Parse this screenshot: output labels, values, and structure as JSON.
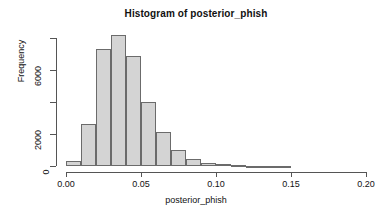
{
  "chart_data": {
    "type": "bar",
    "title": "Histogram of posterior_phish",
    "xlabel": "posterior_phish",
    "ylabel": "Frequency",
    "xlim": [
      0.0,
      0.2
    ],
    "ylim": [
      0,
      8400
    ],
    "grid": false,
    "legend": null,
    "bin_width": 0.01,
    "xticks": [
      0.0,
      0.05,
      0.1,
      0.15,
      0.2
    ],
    "xtick_labels": [
      "0.00",
      "0.05",
      "0.10",
      "0.15",
      "0.20"
    ],
    "yticks": [
      0,
      2000,
      4000,
      6000,
      8000
    ],
    "ytick_labels": [
      "0",
      "2000",
      "",
      "6000",
      ""
    ],
    "bin_edges": [
      0.0,
      0.01,
      0.02,
      0.03,
      0.04,
      0.05,
      0.06,
      0.07,
      0.08,
      0.09,
      0.1,
      0.11,
      0.12,
      0.13,
      0.14,
      0.15
    ],
    "categories": [
      "0.00-0.01",
      "0.01-0.02",
      "0.02-0.03",
      "0.03-0.04",
      "0.04-0.05",
      "0.05-0.06",
      "0.06-0.07",
      "0.07-0.08",
      "0.08-0.09",
      "0.09-0.10",
      "0.10-0.11",
      "0.11-0.12",
      "0.12-0.13",
      "0.13-0.14",
      "0.14-0.15"
    ],
    "values": [
      300,
      2600,
      7300,
      8200,
      6900,
      4000,
      2100,
      1000,
      450,
      180,
      100,
      45,
      25,
      15,
      10
    ],
    "bar_fill_color": "#d4d4d4",
    "bar_border_color": "#6b6b6b",
    "axis_color": "#555555",
    "text_color": "#111111",
    "background_color": "#ffffff"
  }
}
